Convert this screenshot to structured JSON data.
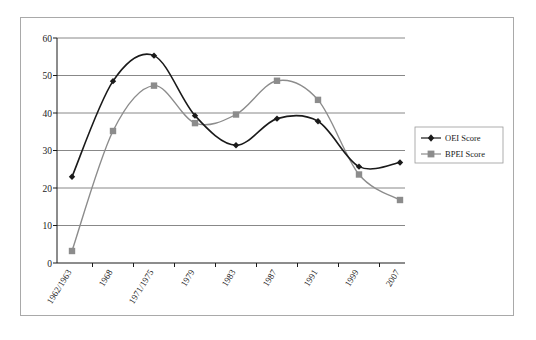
{
  "chart_data": {
    "type": "line",
    "title": "",
    "subtitle": "",
    "xlabel": "",
    "ylabel": "",
    "categories": [
      "1962/1963",
      "1968",
      "1971/1975",
      "1979",
      "1983",
      "1987",
      "1991",
      "1999",
      "2007"
    ],
    "series": [
      {
        "name": "OEI Score",
        "color": "#1a1a1a",
        "marker": "diamond",
        "values": [
          23.0,
          48.5,
          55.3,
          39.3,
          31.4,
          38.5,
          37.8,
          25.7,
          26.8
        ]
      },
      {
        "name": "BPEI Score",
        "color": "#8c8c8c",
        "marker": "square",
        "values": [
          3.2,
          35.2,
          47.3,
          37.3,
          39.6,
          48.6,
          43.5,
          23.6,
          16.8
        ]
      }
    ],
    "ylim": [
      0,
      60
    ],
    "yticks": [
      0,
      10,
      20,
      30,
      40,
      50,
      60
    ],
    "ytick_labels": [
      "0",
      "10",
      "20",
      "30",
      "40",
      "50",
      "60"
    ],
    "grid": true,
    "grid_axis": "y",
    "legend_position": "right",
    "smoothing": "spline",
    "frame": true
  },
  "legend": {
    "items": [
      {
        "label": "OEI Score",
        "color": "#1a1a1a",
        "marker": "diamond"
      },
      {
        "label": "BPEI Score",
        "color": "#8c8c8c",
        "marker": "square"
      }
    ]
  },
  "axis": {
    "y_tick_0": "0",
    "y_tick_1": "10",
    "y_tick_2": "20",
    "y_tick_3": "30",
    "y_tick_4": "40",
    "y_tick_5": "50",
    "y_tick_6": "60",
    "x_tick_0": "1962/1963",
    "x_tick_1": "1968",
    "x_tick_2": "1971/1975",
    "x_tick_3": "1979",
    "x_tick_4": "1983",
    "x_tick_5": "1987",
    "x_tick_6": "1991",
    "x_tick_7": "1999",
    "x_tick_8": "2007"
  },
  "colors": {
    "series_oei": "#1a1a1a",
    "series_bpei": "#8c8c8c",
    "gridline": "#7a7a7a",
    "axis": "#1a1a1a",
    "frame": "#a9a9a9",
    "background": "#ffffff"
  }
}
